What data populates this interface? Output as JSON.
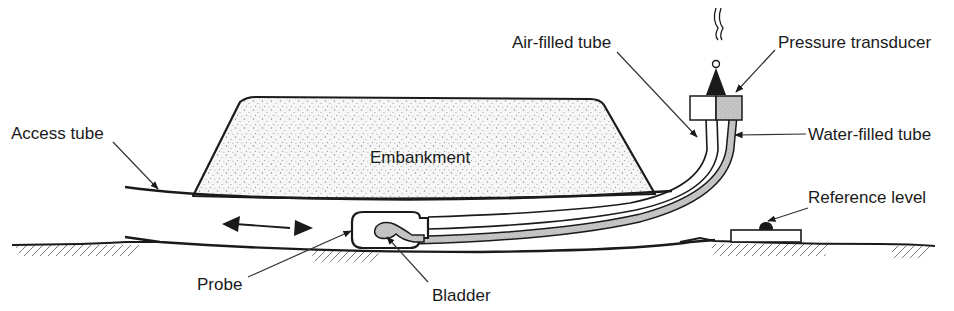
{
  "diagram": {
    "labels": {
      "access_tube": "Access tube",
      "embankment": "Embankment",
      "air_filled_tube": "Air-filled tube",
      "pressure_transducer": "Pressure transducer",
      "water_filled_tube": "Water-filled tube",
      "reference_level": "Reference level",
      "probe": "Probe",
      "bladder": "Bladder"
    },
    "colors": {
      "line": "#1a1a1a",
      "fill_grey": "#c8c8c8",
      "stipple_bg": "#f4f4f4",
      "stipple_dot": "#8a8a8a",
      "background": "#ffffff"
    },
    "components": [
      {
        "id": "embankment",
        "shape": "trapezoid-stippled"
      },
      {
        "id": "access_tube",
        "shape": "curved-pipe"
      },
      {
        "id": "probe",
        "shape": "rounded-rect",
        "movement": "double-arrow"
      },
      {
        "id": "bladder",
        "shape": "grey-blob"
      },
      {
        "id": "air_filled_tube",
        "shape": "two-line-tube"
      },
      {
        "id": "water_filled_tube",
        "shape": "grey-tube"
      },
      {
        "id": "pressure_transducer",
        "shape": "split-box-white-grey"
      },
      {
        "id": "reference_level",
        "shape": "plate-with-dome"
      }
    ]
  }
}
